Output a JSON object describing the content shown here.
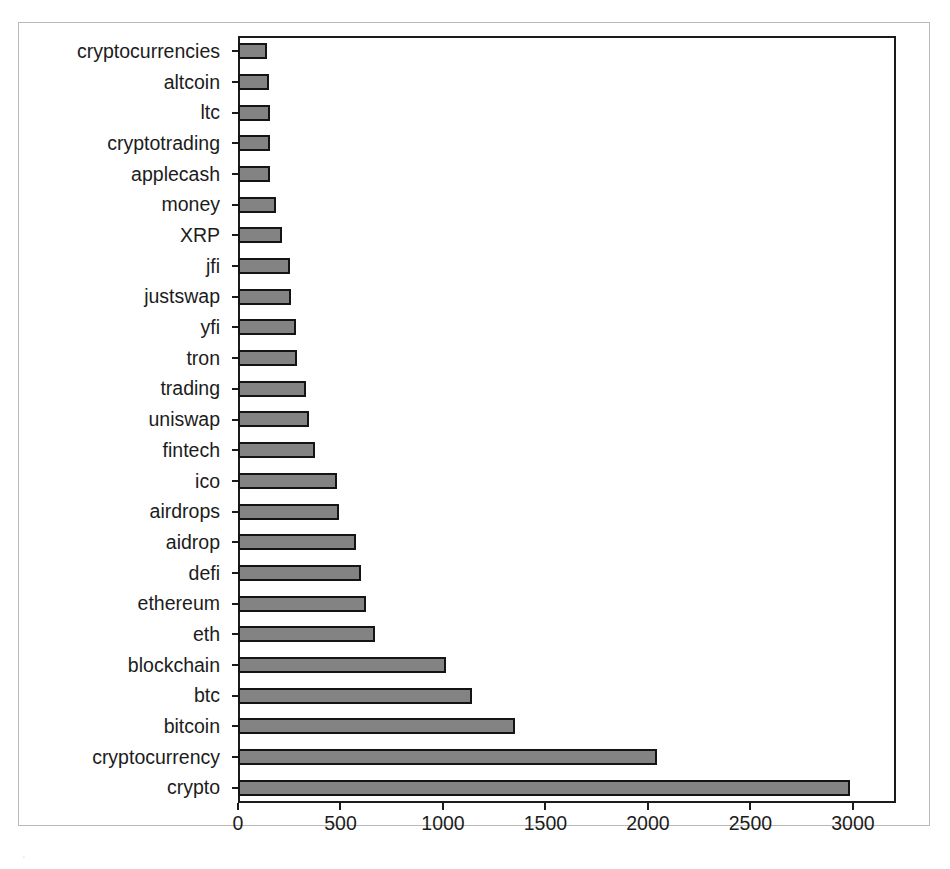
{
  "figure": {
    "background_color": "#ffffff",
    "frame_color": "#b9b9b9",
    "axis_color": "#1b1b1b",
    "bar_fill_color": "#838383",
    "bar_edge_color": "#141414",
    "caption_partial": "."
  },
  "chart_data": {
    "type": "bar",
    "orientation": "horizontal",
    "title": "",
    "xlabel": "",
    "ylabel": "",
    "grid": false,
    "legend": null,
    "xlim": [
      0,
      3210
    ],
    "xticks": [
      0,
      500,
      1000,
      1500,
      2000,
      2500,
      3000
    ],
    "xtick_labels": [
      "0",
      "500",
      "1000",
      "1500",
      "2000",
      "2500",
      "3000"
    ],
    "categories": [
      "cryptocurrencies",
      "altcoin",
      "ltc",
      "cryptotrading",
      "applecash",
      "money",
      "XRP",
      "jfi",
      "justswap",
      "yfi",
      "tron",
      "trading",
      "uniswap",
      "fintech",
      "ico",
      "airdrops",
      "aidrop",
      "defi",
      "ethereum",
      "eth",
      "blockchain",
      "btc",
      "bitcoin",
      "cryptocurrency",
      "crypto"
    ],
    "values": [
      140,
      150,
      155,
      155,
      158,
      185,
      215,
      255,
      260,
      285,
      290,
      330,
      345,
      375,
      485,
      495,
      575,
      600,
      625,
      670,
      1015,
      1140,
      1350,
      2045,
      2985
    ]
  }
}
